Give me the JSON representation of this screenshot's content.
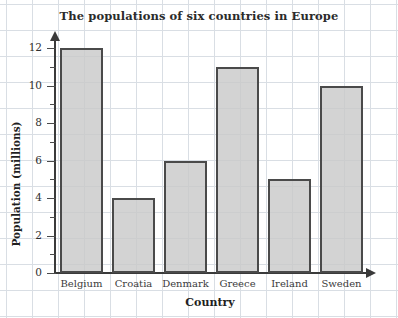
{
  "chart_data": {
    "type": "bar",
    "title": "The populations of six countries in Europe",
    "xlabel": "Country",
    "ylabel": "Population (millions)",
    "categories": [
      "Belgium",
      "Croatia",
      "Denmark",
      "Greece",
      "Ireland",
      "Sweden"
    ],
    "values": [
      12,
      4,
      6,
      11,
      5,
      10
    ],
    "ylim": [
      0,
      12
    ],
    "ytick_labels": [
      "0",
      "2",
      "4",
      "6",
      "8",
      "10",
      "12"
    ],
    "ytick_values": [
      0,
      2,
      4,
      6,
      8,
      10,
      12
    ],
    "minor_tick_values": [
      1,
      3,
      5,
      7,
      9,
      11
    ],
    "grid": true,
    "legend": "none",
    "colors": {
      "bar_fill": "#c8c8c8",
      "bar_border": "#4a4a4a",
      "axis": "#3a3a3a",
      "grid": "#d9dee4",
      "text": "#2b2b2b",
      "background": "#ffffff"
    }
  }
}
